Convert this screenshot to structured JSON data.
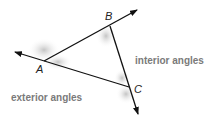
{
  "diagram": {
    "vertices": {
      "A": {
        "label": "A",
        "x": 44,
        "y": 61
      },
      "B": {
        "label": "B",
        "x": 110,
        "y": 26
      },
      "C": {
        "label": "C",
        "x": 129,
        "y": 87
      }
    },
    "labels": {
      "interior": "interior angles",
      "exterior": "exterior angles"
    },
    "colors": {
      "line": "#111111",
      "shade": "#bdbdbd",
      "caption": "#7a7a7a"
    }
  }
}
